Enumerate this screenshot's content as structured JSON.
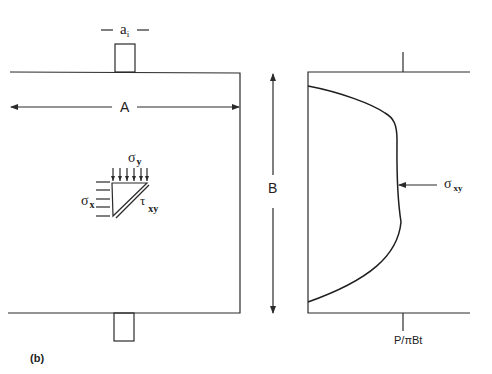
{
  "figure": {
    "panel_label": "(b)",
    "left_panel": {
      "dimension_width_label": "A",
      "loading_width_label": "a",
      "loading_width_subscript": "i",
      "stress_element": {
        "sigma_x": "σ",
        "sigma_x_sub": "x",
        "sigma_y": "σ",
        "sigma_y_sub": "y",
        "tau_xy": "τ",
        "tau_xy_sub": "xy"
      }
    },
    "height_label": "B",
    "right_panel": {
      "curve_label": "σ",
      "curve_label_sub": "xy",
      "axis_tick_label": "P/πBt"
    }
  }
}
